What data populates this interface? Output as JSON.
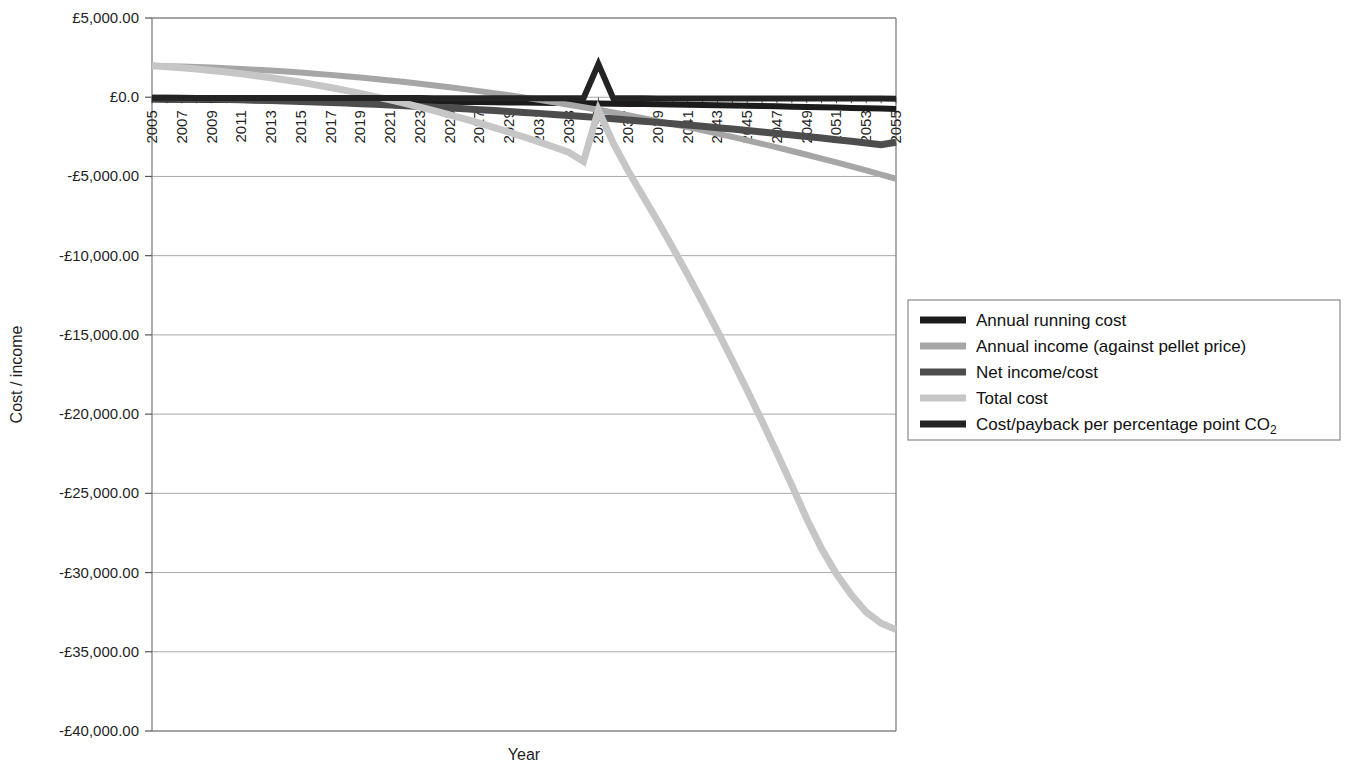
{
  "chart_data": {
    "type": "line",
    "title": "",
    "xlabel": "Year",
    "ylabel": "Cost / income",
    "grid": true,
    "legend_position": "right",
    "xlim": [
      2005,
      2055
    ],
    "ylim": [
      -40000,
      5000
    ],
    "x_tick_labels": [
      "2005",
      "2007",
      "2009",
      "2011",
      "2013",
      "2015",
      "2017",
      "2019",
      "2021",
      "2023",
      "2025",
      "2027",
      "2029",
      "2031",
      "2033",
      "2035",
      "2037",
      "2039",
      "2041",
      "2043",
      "2045",
      "2047",
      "2049",
      "2051",
      "2053",
      "2055"
    ],
    "y_tick_labels": [
      "£5,000.00",
      "£0.0",
      "-£5,000.00",
      "-£10,000.00",
      "-£15,000.00",
      "-£20,000.00",
      "-£25,000.00",
      "-£30,000.00",
      "-£35,000.00",
      "-£40,000.00"
    ],
    "y_tick_values": [
      5000,
      0,
      -5000,
      -10000,
      -15000,
      -20000,
      -25000,
      -30000,
      -35000,
      -40000
    ],
    "x": [
      2005,
      2006,
      2007,
      2008,
      2009,
      2010,
      2011,
      2012,
      2013,
      2014,
      2015,
      2016,
      2017,
      2018,
      2019,
      2020,
      2021,
      2022,
      2023,
      2024,
      2025,
      2026,
      2027,
      2028,
      2029,
      2030,
      2031,
      2032,
      2033,
      2034,
      2035,
      2036,
      2037,
      2038,
      2039,
      2040,
      2041,
      2042,
      2043,
      2044,
      2045,
      2046,
      2047,
      2048,
      2049,
      2050,
      2051,
      2052,
      2053,
      2054,
      2055
    ],
    "series": [
      {
        "name": "Annual running cost",
        "color": "#1c1c1c",
        "width": 6,
        "values": [
          -150,
          -155,
          -160,
          -165,
          -170,
          -175,
          -182,
          -188,
          -195,
          -200,
          -208,
          -215,
          -222,
          -230,
          -238,
          -246,
          -254,
          -262,
          -271,
          -280,
          -289,
          -298,
          -308,
          -318,
          -328,
          -339,
          -350,
          -361,
          -372,
          -384,
          -396,
          -409,
          -422,
          -435,
          -449,
          -463,
          -478,
          -493,
          -509,
          -525,
          -541,
          -558,
          -576,
          -594,
          -613,
          -632,
          -652,
          -673,
          -694,
          -716,
          -739
        ]
      },
      {
        "name": "Annual income (against pellet price)",
        "color": "#a6a6a6",
        "width": 6,
        "values": [
          1980,
          1960,
          1935,
          1905,
          1870,
          1830,
          1785,
          1735,
          1680,
          1620,
          1555,
          1485,
          1410,
          1330,
          1245,
          1155,
          1060,
          960,
          855,
          745,
          630,
          510,
          385,
          255,
          120,
          -20,
          -165,
          -315,
          -470,
          -630,
          -795,
          -965,
          -1140,
          -1320,
          -1505,
          -1695,
          -1890,
          -2090,
          -2295,
          -2505,
          -2720,
          -2940,
          -3165,
          -3395,
          -3630,
          -3870,
          -4115,
          -4365,
          -4620,
          -4880,
          -5145
        ]
      },
      {
        "name": "Net income/cost",
        "color": "#4d4d4d",
        "width": 7,
        "values": [
          -60,
          -70,
          -85,
          -100,
          -118,
          -138,
          -160,
          -184,
          -210,
          -238,
          -268,
          -300,
          -334,
          -370,
          -408,
          -448,
          -490,
          -534,
          -580,
          -628,
          -678,
          -730,
          -784,
          -840,
          -898,
          -958,
          -1020,
          -1084,
          -1150,
          -1218,
          -1288,
          -1360,
          -1434,
          -1510,
          -1588,
          -1668,
          -1750,
          -1834,
          -1920,
          -2008,
          -2098,
          -2190,
          -2284,
          -2380,
          -2478,
          -2578,
          -2680,
          -2784,
          -2890,
          -2998,
          -2840
        ]
      },
      {
        "name": "Total cost",
        "color": "#c6c6c6",
        "width": 7,
        "values": [
          1980,
          1930,
          1860,
          1780,
          1690,
          1590,
          1480,
          1360,
          1230,
          1090,
          940,
          780,
          610,
          430,
          240,
          40,
          -170,
          -390,
          -620,
          -860,
          -1110,
          -1370,
          -1640,
          -1920,
          -2210,
          -2510,
          -2820,
          -3140,
          -3470,
          -4050,
          -830,
          -2900,
          -4650,
          -6250,
          -7850,
          -9500,
          -11200,
          -12950,
          -14750,
          -16600,
          -18500,
          -20450,
          -22450,
          -24500,
          -26600,
          -28500,
          -30100,
          -31400,
          -32500,
          -33200,
          -33600
        ]
      },
      {
        "name": "Cost/payback per percentage point CO₂",
        "color": "#232323",
        "width": 6,
        "values": [
          -40,
          -40,
          -40,
          -42,
          -42,
          -44,
          -44,
          -46,
          -46,
          -48,
          -48,
          -50,
          -50,
          -52,
          -52,
          -54,
          -54,
          -56,
          -56,
          -58,
          -58,
          -60,
          -60,
          -62,
          -62,
          -64,
          -64,
          -66,
          -66,
          -68,
          2100,
          -70,
          -72,
          -72,
          -74,
          -74,
          -76,
          -76,
          -78,
          -78,
          -80,
          -80,
          -82,
          -82,
          -84,
          -84,
          -86,
          -86,
          -88,
          -88,
          -90
        ]
      }
    ],
    "legend_entries": [
      {
        "label": "Annual running cost",
        "color": "#1c1c1c"
      },
      {
        "label": "Annual income (against pellet price)",
        "color": "#a6a6a6"
      },
      {
        "label": "Net income/cost",
        "color": "#4d4d4d"
      },
      {
        "label": "Total cost",
        "color": "#c6c6c6"
      },
      {
        "label": "Cost/payback per percentage point CO",
        "sub": "2",
        "color": "#232323"
      }
    ]
  }
}
